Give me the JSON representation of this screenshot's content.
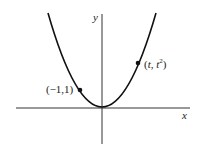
{
  "diagram": {
    "curve": "y = x^2",
    "axes": {
      "x_label": "x",
      "y_label": "y"
    },
    "points": [
      {
        "label": "(−1,1)",
        "x": -1,
        "y": 1
      },
      {
        "label_t": "t",
        "label_t2": "t",
        "sup": "2",
        "x": "t",
        "y": "t^2"
      }
    ]
  }
}
